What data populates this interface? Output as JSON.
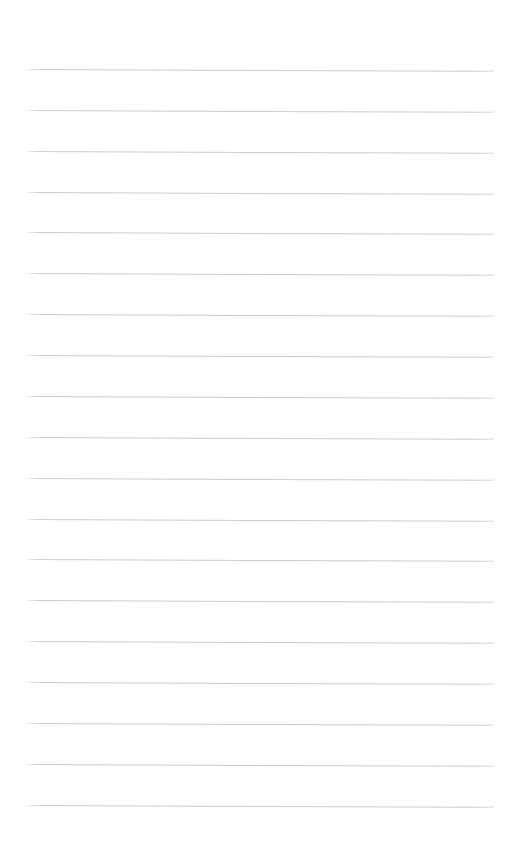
{
  "document": {
    "type": "ruled-notepad-page",
    "title": "Blank ruled notepad page",
    "description": "A blank lined writing page with no written content",
    "content_text": "",
    "page_width": 519,
    "page_height": 848,
    "background_color": "#ffffff",
    "rule_color": "#c9c9cc",
    "rule_thickness_px": 1,
    "rule_count": 19,
    "rule_left_x": 26,
    "rule_right_x": 494,
    "rule_length_px": 468,
    "first_rule_y": 69,
    "rule_spacing_px": 40.9,
    "slant_degrees": 0.22,
    "top_margin_px": 69,
    "bottom_margin_px": 36,
    "has_margin_rule": false,
    "has_holes": false,
    "has_header_text": false,
    "has_footer_text": false,
    "rules": [
      {
        "index": 1,
        "y": 69,
        "label": "line-1"
      },
      {
        "index": 2,
        "y": 110,
        "label": "line-2"
      },
      {
        "index": 3,
        "y": 151,
        "label": "line-3"
      },
      {
        "index": 4,
        "y": 192,
        "label": "line-4"
      },
      {
        "index": 5,
        "y": 232,
        "label": "line-5"
      },
      {
        "index": 6,
        "y": 273,
        "label": "line-6"
      },
      {
        "index": 7,
        "y": 314,
        "label": "line-7"
      },
      {
        "index": 8,
        "y": 355,
        "label": "line-8"
      },
      {
        "index": 9,
        "y": 396,
        "label": "line-9"
      },
      {
        "index": 10,
        "y": 437,
        "label": "line-10"
      },
      {
        "index": 11,
        "y": 478,
        "label": "line-11"
      },
      {
        "index": 12,
        "y": 519,
        "label": "line-12"
      },
      {
        "index": 13,
        "y": 559,
        "label": "line-13"
      },
      {
        "index": 14,
        "y": 600,
        "label": "line-14"
      },
      {
        "index": 15,
        "y": 641,
        "label": "line-15"
      },
      {
        "index": 16,
        "y": 682,
        "label": "line-16"
      },
      {
        "index": 17,
        "y": 723,
        "label": "line-17"
      },
      {
        "index": 18,
        "y": 764,
        "label": "line-18"
      },
      {
        "index": 19,
        "y": 805,
        "label": "line-19"
      }
    ],
    "line_entries": [
      {
        "index": 1,
        "text": ""
      },
      {
        "index": 2,
        "text": ""
      },
      {
        "index": 3,
        "text": ""
      },
      {
        "index": 4,
        "text": ""
      },
      {
        "index": 5,
        "text": ""
      },
      {
        "index": 6,
        "text": ""
      },
      {
        "index": 7,
        "text": ""
      },
      {
        "index": 8,
        "text": ""
      },
      {
        "index": 9,
        "text": ""
      },
      {
        "index": 10,
        "text": ""
      },
      {
        "index": 11,
        "text": ""
      },
      {
        "index": 12,
        "text": ""
      },
      {
        "index": 13,
        "text": ""
      },
      {
        "index": 14,
        "text": ""
      },
      {
        "index": 15,
        "text": ""
      },
      {
        "index": 16,
        "text": ""
      },
      {
        "index": 17,
        "text": ""
      },
      {
        "index": 18,
        "text": ""
      },
      {
        "index": 19,
        "text": ""
      }
    ]
  }
}
